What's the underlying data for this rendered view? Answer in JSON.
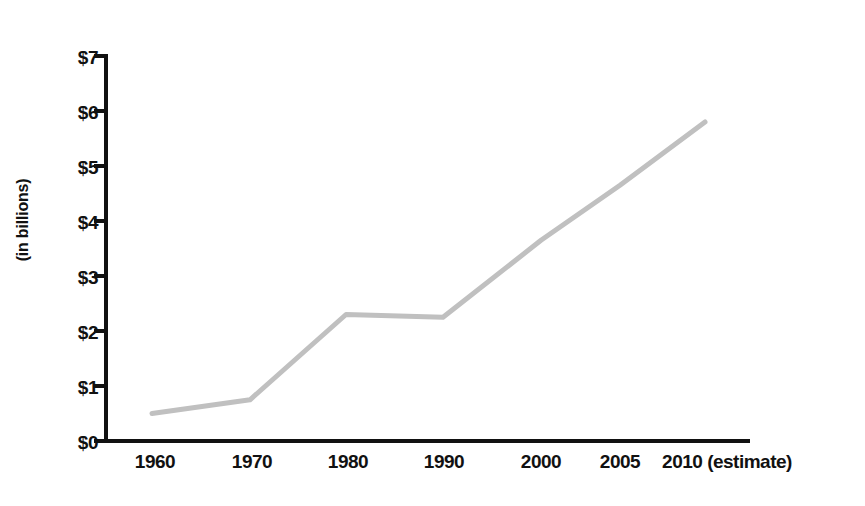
{
  "chart_data": {
    "type": "line",
    "title": "",
    "subtitle": "",
    "xlabel": "",
    "ylabel": "(in billions)",
    "categories": [
      "1960",
      "1970",
      "1980",
      "1990",
      "2000",
      "2005",
      "2010"
    ],
    "x_tick_labels": [
      "1960",
      "1970",
      "1980",
      "1990",
      "2000",
      "2005",
      "2010 (estimate)"
    ],
    "last_x_annotation": "(estimate)",
    "values": [
      0.5,
      0.75,
      2.3,
      2.25,
      3.65,
      4.65,
      5.8
    ],
    "series": [
      {
        "name": "",
        "values": [
          0.5,
          0.75,
          2.3,
          2.25,
          3.65,
          4.65,
          5.8
        ]
      }
    ],
    "y_tick_labels": [
      "$0",
      "$1",
      "$2",
      "$3",
      "$4",
      "$5",
      "$6",
      "$7"
    ],
    "y_tick_values": [
      0,
      1,
      2,
      3,
      4,
      5,
      6,
      7
    ],
    "ylim": [
      0,
      7
    ],
    "grid": false,
    "legend": false,
    "legend_position": "none",
    "line_color": "#c0c0c0",
    "axis_color": "#111111",
    "text_color": "#111111",
    "background_color": "#ffffff"
  }
}
